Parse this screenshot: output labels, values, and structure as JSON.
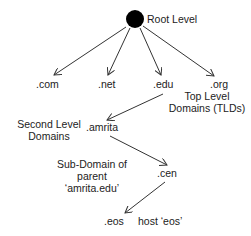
{
  "diagram": {
    "root": {
      "label": "Root Level"
    },
    "tlds": [
      {
        "label": ".com"
      },
      {
        "label": ".net"
      },
      {
        "label": ".edu"
      },
      {
        "label": ".org"
      }
    ],
    "tld_annotation": {
      "line1": "Top Level",
      "line2": "Domains (TLDs)"
    },
    "second_level": {
      "label": ".amrita"
    },
    "second_level_annotation": {
      "line1": "Second Level",
      "line2": "Domains"
    },
    "sub_domain": {
      "label": ".cen"
    },
    "sub_domain_annotation": {
      "line1": "Sub-Domain of",
      "line2": "parent",
      "line3": "‘amrita.edu’"
    },
    "host": {
      "label": ".eos"
    },
    "host_annotation": {
      "label": "host ‘eos’"
    },
    "colors": {
      "node": "#000000",
      "edge": "#333333",
      "text": "#222222"
    }
  }
}
